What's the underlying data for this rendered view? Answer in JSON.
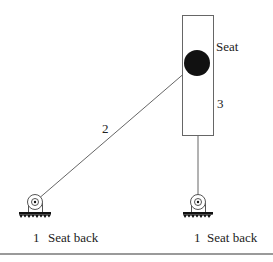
{
  "diagram": {
    "title": "",
    "labels": {
      "seat": "Seat",
      "link_seat_number": "3",
      "link_rod_number": "2",
      "left_ground_number": "1",
      "left_ground_label": "Seat back",
      "right_ground_number": "1",
      "right_ground_label": "Seat back"
    },
    "nodes": [
      {
        "id": "seat",
        "label": "Seat",
        "shape": "rectangle",
        "number": "3"
      },
      {
        "id": "seat-joint",
        "shape": "filled-circle",
        "color": "#111111"
      },
      {
        "id": "left-pivot",
        "shape": "ground-pivot",
        "label": "Seat back",
        "number": "1"
      },
      {
        "id": "right-pivot",
        "shape": "ground-pivot",
        "label": "Seat back",
        "number": "1"
      }
    ],
    "edges": [
      {
        "from": "seat-joint",
        "to": "left-pivot",
        "label": "2"
      },
      {
        "from": "seat",
        "to": "right-pivot",
        "label": ""
      }
    ],
    "colors": {
      "stroke": "#555555",
      "fill_joint": "#111111",
      "ground": "#111111",
      "rule": "#9a9a9a"
    }
  }
}
